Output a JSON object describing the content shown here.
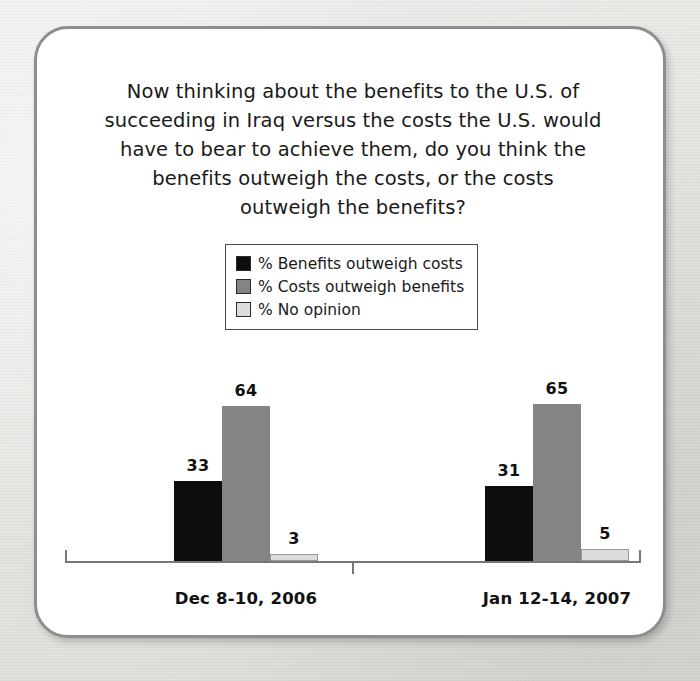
{
  "card": {
    "title": "Now thinking about the benefits to the U.S. of\nsucceeding in Iraq versus the costs the U.S. would\nhave to bear to achieve them, do you think the\nbenefits outweigh the costs, or the costs\noutweigh the benefits?"
  },
  "colors": {
    "series_benefits": "#0d0d0d",
    "series_costs": "#848484",
    "series_no_opinion": "#dcdcdc",
    "axis": "#777777",
    "card_border": "#8e8e8e",
    "text": "#1a1a1a",
    "page_background": "#e9e9e7"
  },
  "legend": {
    "entries": [
      {
        "label": "% Benefits outweigh costs",
        "color": "#0d0d0d"
      },
      {
        "label": "% Costs outweigh benefits",
        "color": "#848484"
      },
      {
        "label": "% No opinion",
        "color": "#dcdcdc"
      }
    ]
  },
  "chart_data": {
    "type": "bar",
    "title": "Now thinking about the benefits to the U.S. of succeeding in Iraq versus the costs the U.S. would have to bear to achieve them, do you think the benefits outweigh the costs, or the costs outweigh the benefits?",
    "xlabel": "",
    "ylabel": "",
    "ylim": [
      0,
      70
    ],
    "grid": false,
    "legend_position": "top-center",
    "axis_visible": true,
    "value_labels": true,
    "categories": [
      "Dec 8-10, 2006",
      "Jan 12-14, 2007"
    ],
    "series": [
      {
        "name": "% Benefits outweigh costs",
        "color": "#0d0d0d",
        "values": [
          33,
          31
        ]
      },
      {
        "name": "% Costs outweigh benefits",
        "color": "#848484",
        "values": [
          64,
          65
        ]
      },
      {
        "name": "% No opinion",
        "color": "#dcdcdc",
        "values": [
          3,
          5
        ]
      }
    ]
  }
}
